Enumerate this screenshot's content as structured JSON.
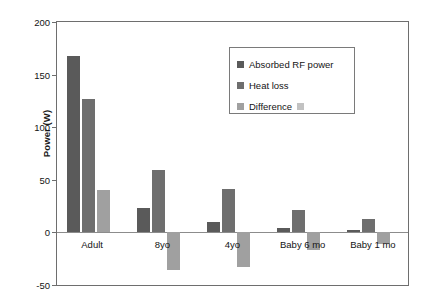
{
  "chart_data": {
    "type": "bar",
    "title": "",
    "xlabel": "",
    "ylabel": "Power (W)",
    "categories": [
      "Adult",
      "8yo",
      "4yo",
      "Baby 6 mo",
      "Baby 1 mo"
    ],
    "series": [
      {
        "name": "Absorbed RF power",
        "color": "#5a5a5a",
        "values": [
          168,
          23,
          10,
          4,
          2
        ]
      },
      {
        "name": "Heat loss",
        "color": "#6e6e6e",
        "values": [
          127,
          59,
          41,
          21,
          13
        ]
      },
      {
        "name": "Difference",
        "color": "#a0a0a0",
        "values": [
          40,
          -36,
          -33,
          -17,
          -11
        ]
      }
    ],
    "ylim": [
      -50,
      200
    ],
    "yticks": [
      200,
      150,
      100,
      50,
      0,
      -50
    ],
    "ytick_labels": [
      "200",
      "150",
      "100",
      "50",
      "0",
      "-50"
    ],
    "grid": false,
    "legend_position": "upper-right-inside"
  },
  "legend": {
    "entries": [
      {
        "label": "Absorbed RF power",
        "color": "#5a5a5a",
        "trailing_swatch": false
      },
      {
        "label": "Heat loss",
        "color": "#6e6e6e",
        "trailing_swatch": false
      },
      {
        "label": "Difference",
        "color": "#a0a0a0",
        "trailing_swatch": true,
        "trailing_color": "#c2c2c2"
      }
    ]
  },
  "axis": {
    "frame_color": "#6e6e6e",
    "zero_line_color": "#8c8c8c",
    "tick_color": "#6e6e6e",
    "text_color": "#141414"
  }
}
